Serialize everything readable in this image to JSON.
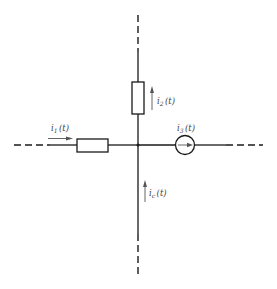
{
  "diagram": {
    "type": "circuit-node",
    "colors": {
      "line": "#1a1a1a",
      "arrow": "#555555",
      "label": "#444444",
      "background": "#ffffff"
    },
    "branches": {
      "left": {
        "component": "resistor",
        "current_label": {
          "base": "i",
          "sub": "1",
          "arg": "(t)"
        },
        "arrow_direction": "right"
      },
      "top": {
        "component": "resistor",
        "current_label": {
          "base": "i",
          "sub": "2",
          "arg": "(t)"
        },
        "arrow_direction": "up"
      },
      "right": {
        "component": "current-source",
        "current_label": {
          "base": "i",
          "sub": "3",
          "arg": "(t)"
        },
        "arrow_direction": "right"
      },
      "bottom": {
        "component": "wire",
        "current_label": {
          "base": "i",
          "sub": "c",
          "arg": "(t)"
        },
        "arrow_direction": "up"
      }
    }
  }
}
